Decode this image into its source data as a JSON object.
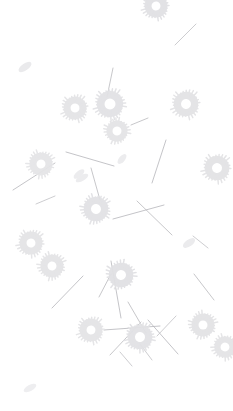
{
  "scene": {
    "title": "Scattered Botanical Pattern",
    "description": "Pale grey scattered dandelion-like radial discs, thin straight stem lines and small tilted seed ellipses on a white background",
    "width": 233,
    "height": 411,
    "background_color": "#ffffff"
  },
  "palette": {
    "background": "#ffffff",
    "flower_fill": "#e3e3e5",
    "flower_fill_light": "#eaeaec",
    "flower_core": "#ffffff",
    "seed_fill": "#ececee",
    "stem_stroke": "#b9b9bd",
    "stem_stroke_light": "#cfcfd3"
  },
  "elements": {
    "flowers": [
      {
        "name": "flower-top-edge",
        "cx": 156,
        "cy": 6,
        "r": 14,
        "core": 4.5,
        "rays": 26,
        "rotation": 12,
        "fill": "#e1e1e4",
        "opacity": 0.95
      },
      {
        "name": "flower-upper-left-cluster-a",
        "cx": 75,
        "cy": 108,
        "r": 14,
        "core": 4.5,
        "rays": 26,
        "rotation": 5,
        "fill": "#e4e4e6",
        "opacity": 0.95
      },
      {
        "name": "flower-upper-mid-large",
        "cx": 110,
        "cy": 104,
        "r": 16,
        "core": 5.5,
        "rays": 28,
        "rotation": 22,
        "fill": "#e2e2e5",
        "opacity": 0.95
      },
      {
        "name": "flower-upper-mid-lower",
        "cx": 117,
        "cy": 131,
        "r": 13,
        "core": 4.5,
        "rays": 24,
        "rotation": 40,
        "fill": "#e4e4e6",
        "opacity": 0.95
      },
      {
        "name": "flower-upper-right",
        "cx": 186,
        "cy": 104,
        "r": 15,
        "core": 5,
        "rays": 26,
        "rotation": 8,
        "fill": "#e3e3e5",
        "opacity": 0.95
      },
      {
        "name": "flower-mid-left",
        "cx": 41,
        "cy": 164,
        "r": 14,
        "core": 4.5,
        "rays": 26,
        "rotation": 30,
        "fill": "#e5e5e7",
        "opacity": 0.95
      },
      {
        "name": "flower-mid-right",
        "cx": 217,
        "cy": 168,
        "r": 15,
        "core": 5,
        "rays": 26,
        "rotation": 16,
        "fill": "#e3e3e5",
        "opacity": 0.95
      },
      {
        "name": "flower-center",
        "cx": 96,
        "cy": 209,
        "r": 15,
        "core": 5,
        "rays": 28,
        "rotation": 48,
        "fill": "#e2e2e5",
        "opacity": 0.95
      },
      {
        "name": "flower-lower-left-upper",
        "cx": 31,
        "cy": 243,
        "r": 14,
        "core": 4.5,
        "rays": 26,
        "rotation": 18,
        "fill": "#e4e4e6",
        "opacity": 0.95
      },
      {
        "name": "flower-lower-left-lower",
        "cx": 52,
        "cy": 266,
        "r": 14,
        "core": 4.5,
        "rays": 26,
        "rotation": 34,
        "fill": "#e4e4e6",
        "opacity": 0.95
      },
      {
        "name": "flower-center-low",
        "cx": 121,
        "cy": 275,
        "r": 15,
        "core": 5,
        "rays": 26,
        "rotation": 60,
        "fill": "#e1e1e4",
        "opacity": 0.95
      },
      {
        "name": "flower-bottom-left",
        "cx": 91,
        "cy": 330,
        "r": 14,
        "core": 4.5,
        "rays": 26,
        "rotation": 10,
        "fill": "#e4e4e6",
        "opacity": 0.95
      },
      {
        "name": "flower-bottom-center",
        "cx": 140,
        "cy": 337,
        "r": 15,
        "core": 5,
        "rays": 28,
        "rotation": 26,
        "fill": "#e2e2e5",
        "opacity": 0.95
      },
      {
        "name": "flower-bottom-right-upper",
        "cx": 203,
        "cy": 325,
        "r": 14,
        "core": 4.5,
        "rays": 26,
        "rotation": 44,
        "fill": "#e3e3e5",
        "opacity": 0.95
      },
      {
        "name": "flower-bottom-right-lower",
        "cx": 225,
        "cy": 347,
        "r": 13,
        "core": 4.5,
        "rays": 24,
        "rotation": 14,
        "fill": "#e4e4e6",
        "opacity": 0.95
      }
    ],
    "seeds": [
      {
        "name": "seed-upper-left",
        "cx": 25,
        "cy": 67,
        "rx": 7.5,
        "ry": 3.5,
        "rotation": -35,
        "fill": "#eaeaec"
      },
      {
        "name": "seed-mid-left",
        "cx": 79,
        "cy": 174,
        "rx": 6.5,
        "ry": 3,
        "rotation": -40,
        "fill": "#ececee"
      },
      {
        "name": "seed-mid-low",
        "cx": 82,
        "cy": 178,
        "rx": 7,
        "ry": 3,
        "rotation": -30,
        "fill": "#ececee"
      },
      {
        "name": "seed-center-left",
        "cx": 122,
        "cy": 159,
        "rx": 6,
        "ry": 3,
        "rotation": -50,
        "fill": "#ececee"
      },
      {
        "name": "seed-center-right",
        "cx": 189,
        "cy": 243,
        "rx": 7,
        "ry": 3.5,
        "rotation": -35,
        "fill": "#ebebed"
      },
      {
        "name": "seed-bottom-left",
        "cx": 30,
        "cy": 388,
        "rx": 7,
        "ry": 3,
        "rotation": -28,
        "fill": "#eeeef0"
      }
    ],
    "stems": [
      {
        "name": "stem-upper-right-1",
        "x1": 175,
        "y1": 45,
        "x2": 196,
        "y2": 24,
        "stroke": "#c0c0c4",
        "width": 0.8
      },
      {
        "name": "stem-upper-mid-1",
        "x1": 113,
        "y1": 68,
        "x2": 107,
        "y2": 97,
        "stroke": "#b9b9bd",
        "width": 0.8
      },
      {
        "name": "stem-upper-mid-2",
        "x1": 131,
        "y1": 125,
        "x2": 148,
        "y2": 118,
        "stroke": "#b9b9bd",
        "width": 0.8
      },
      {
        "name": "stem-mid-left-1",
        "x1": 13,
        "y1": 190,
        "x2": 55,
        "y2": 163,
        "stroke": "#b5b5ba",
        "width": 0.8
      },
      {
        "name": "stem-mid-left-2",
        "x1": 36,
        "y1": 204,
        "x2": 55,
        "y2": 196,
        "stroke": "#c0c0c4",
        "width": 0.8
      },
      {
        "name": "stem-mid-center-1",
        "x1": 66,
        "y1": 152,
        "x2": 114,
        "y2": 166,
        "stroke": "#b5b5ba",
        "width": 0.8
      },
      {
        "name": "stem-mid-center-2",
        "x1": 91,
        "y1": 168,
        "x2": 100,
        "y2": 200,
        "stroke": "#b9b9bd",
        "width": 0.8
      },
      {
        "name": "stem-mid-right-1",
        "x1": 166,
        "y1": 140,
        "x2": 152,
        "y2": 183,
        "stroke": "#b5b5ba",
        "width": 0.8
      },
      {
        "name": "stem-mid-right-2",
        "x1": 113,
        "y1": 219,
        "x2": 164,
        "y2": 205,
        "stroke": "#b5b5ba",
        "width": 0.8
      },
      {
        "name": "stem-mid-right-3",
        "x1": 137,
        "y1": 201,
        "x2": 172,
        "y2": 235,
        "stroke": "#b9b9bd",
        "width": 0.8
      },
      {
        "name": "stem-right-1",
        "x1": 193,
        "y1": 236,
        "x2": 208,
        "y2": 248,
        "stroke": "#c0c0c4",
        "width": 0.8
      },
      {
        "name": "stem-right-2",
        "x1": 194,
        "y1": 274,
        "x2": 214,
        "y2": 300,
        "stroke": "#b9b9bd",
        "width": 0.8
      },
      {
        "name": "stem-lower-left-1",
        "x1": 52,
        "y1": 308,
        "x2": 83,
        "y2": 276,
        "stroke": "#b5b5ba",
        "width": 0.8
      },
      {
        "name": "stem-lower-left-2",
        "x1": 99,
        "y1": 297,
        "x2": 111,
        "y2": 274,
        "stroke": "#b9b9bd",
        "width": 0.8
      },
      {
        "name": "stem-lower-center-1",
        "x1": 111,
        "y1": 261,
        "x2": 121,
        "y2": 318,
        "stroke": "#b5b5ba",
        "width": 0.8
      },
      {
        "name": "stem-lower-center-2",
        "x1": 104,
        "y1": 330,
        "x2": 160,
        "y2": 326,
        "stroke": "#b5b5ba",
        "width": 0.8
      },
      {
        "name": "stem-lower-center-3",
        "x1": 128,
        "y1": 302,
        "x2": 146,
        "y2": 333,
        "stroke": "#b9b9bd",
        "width": 0.8
      },
      {
        "name": "stem-lower-center-4",
        "x1": 110,
        "y1": 355,
        "x2": 141,
        "y2": 322,
        "stroke": "#b9b9bd",
        "width": 0.8
      },
      {
        "name": "stem-lower-right-1",
        "x1": 148,
        "y1": 320,
        "x2": 178,
        "y2": 354,
        "stroke": "#b5b5ba",
        "width": 0.8
      },
      {
        "name": "stem-lower-right-2",
        "x1": 157,
        "y1": 336,
        "x2": 176,
        "y2": 316,
        "stroke": "#c0c0c4",
        "width": 0.8
      },
      {
        "name": "stem-bottom-1",
        "x1": 120,
        "y1": 352,
        "x2": 132,
        "y2": 366,
        "stroke": "#c0c0c4",
        "width": 0.8
      },
      {
        "name": "stem-bottom-2",
        "x1": 140,
        "y1": 344,
        "x2": 152,
        "y2": 360,
        "stroke": "#c0c0c4",
        "width": 0.8
      }
    ]
  }
}
